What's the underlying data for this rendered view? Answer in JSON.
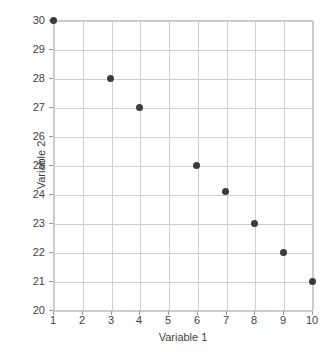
{
  "chart_data": {
    "type": "scatter",
    "title": "",
    "xlabel": "Variable 1",
    "ylabel": "Variable 2",
    "xlim": [
      1,
      10
    ],
    "ylim": [
      20,
      30
    ],
    "xticks": [
      1,
      2,
      3,
      4,
      5,
      6,
      7,
      8,
      9,
      10
    ],
    "yticks": [
      20,
      21,
      22,
      23,
      24,
      25,
      26,
      27,
      28,
      29,
      30
    ],
    "xtick_labels": [
      "1",
      "2",
      "3",
      "4",
      "5",
      "6",
      "7",
      "8",
      "9",
      "10"
    ],
    "ytick_labels": [
      "20",
      "21",
      "22",
      "23",
      "24",
      "25",
      "26",
      "27",
      "28",
      "29",
      "30"
    ],
    "grid": true,
    "legend": null,
    "marker_color": "#3b3b3b",
    "grid_color": "#cfcfcf",
    "frame_color": "#c9c9c9",
    "points": [
      {
        "x": 1,
        "y": 30
      },
      {
        "x": 3,
        "y": 28
      },
      {
        "x": 4,
        "y": 27
      },
      {
        "x": 6,
        "y": 25
      },
      {
        "x": 7,
        "y": 24.1
      },
      {
        "x": 8,
        "y": 23
      },
      {
        "x": 9,
        "y": 22
      },
      {
        "x": 10,
        "y": 21
      }
    ]
  }
}
